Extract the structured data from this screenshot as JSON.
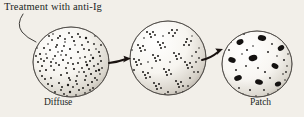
{
  "figure": {
    "type": "biology-illustration",
    "background_color": "#f2efe9",
    "ink_color": "#211f1d",
    "annotation": {
      "text": "Treatment with anti-Ig",
      "leader_line": "curved-pointer-to-first-cell"
    },
    "cells": [
      {
        "id": "cell-diffuse",
        "label": "Diffuse",
        "stage": 1,
        "cx": 71,
        "cy": 62,
        "rx": 38,
        "ry": 35,
        "pattern": "uniform fine stipple",
        "dot_count": 210,
        "dot_size": [
          0.8,
          1.9
        ],
        "clustered": false
      },
      {
        "id": "cell-clustered",
        "label": "",
        "stage": 2,
        "cx": 168,
        "cy": 58,
        "rx": 38,
        "ry": 37,
        "pattern": "dots aggregated into small clumps",
        "dot_count": 150,
        "dot_size": [
          0.9,
          2.0
        ],
        "clustered": true,
        "cluster_count": 13
      },
      {
        "id": "cell-patch",
        "label": "Patch",
        "stage": 3,
        "cx": 257,
        "cy": 64,
        "rx": 35,
        "ry": 33,
        "pattern": "large coalesced dark patches",
        "patch_count": 9,
        "dot_count": 60,
        "clustered": true
      }
    ],
    "arrows": [
      {
        "id": "arrow-1",
        "from_cell": "cell-diffuse",
        "to_cell": "cell-clustered",
        "x1": 110,
        "y1": 62,
        "x2": 130,
        "y2": 59,
        "direction": "right"
      },
      {
        "id": "arrow-2",
        "from_cell": "cell-clustered",
        "to_cell": "cell-patch",
        "x1": 203,
        "y1": 58,
        "x2": 224,
        "y2": 50,
        "direction": "right-up"
      }
    ],
    "labels": {
      "diffuse": "Diffuse",
      "patch": "Patch"
    }
  }
}
